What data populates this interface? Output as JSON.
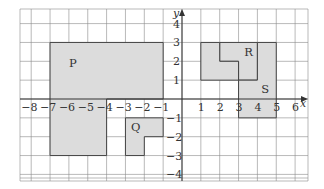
{
  "diagram": {
    "type": "coordinate-grid",
    "x_axis": {
      "label": "x",
      "min": -8,
      "max": 6,
      "ticks": [
        "−8",
        "−7",
        "−6",
        "−5",
        "−4",
        "−3",
        "−2",
        "−1",
        "1",
        "2",
        "3",
        "4",
        "5",
        "6"
      ]
    },
    "y_axis": {
      "label": "y",
      "min": -4,
      "max": 4,
      "ticks": [
        "4",
        "3",
        "2",
        "1",
        "−1",
        "−2",
        "−3",
        "−4"
      ]
    },
    "shapes": [
      {
        "name": "P",
        "label": "P",
        "vertices": [
          [
            -7,
            3
          ],
          [
            -1,
            3
          ],
          [
            -1,
            0
          ],
          [
            -4,
            0
          ],
          [
            -4,
            -3
          ],
          [
            -7,
            -3
          ]
        ],
        "label_pos": [
          -6,
          1.7
        ]
      },
      {
        "name": "Q",
        "label": "Q",
        "vertices": [
          [
            -3,
            -1
          ],
          [
            -1,
            -1
          ],
          [
            -1,
            -2
          ],
          [
            -2,
            -2
          ],
          [
            -2,
            -3
          ],
          [
            -3,
            -3
          ]
        ],
        "label_pos": [
          -2.7,
          -1.7
        ]
      },
      {
        "name": "R",
        "label": "R",
        "vertices": [
          [
            2,
            3
          ],
          [
            4,
            3
          ],
          [
            4,
            1
          ],
          [
            3,
            1
          ],
          [
            3,
            2
          ],
          [
            2,
            2
          ]
        ],
        "label_pos": [
          3.3,
          2.3
        ]
      },
      {
        "name": "unlabeled",
        "label": "",
        "vertices": [
          [
            1,
            3
          ],
          [
            2,
            3
          ],
          [
            2,
            2
          ],
          [
            3,
            2
          ],
          [
            3,
            1
          ],
          [
            1,
            1
          ]
        ]
      },
      {
        "name": "S",
        "label": "S",
        "vertices": [
          [
            4,
            3
          ],
          [
            5,
            3
          ],
          [
            5,
            -1
          ],
          [
            3,
            -1
          ],
          [
            3,
            1
          ],
          [
            4,
            1
          ]
        ],
        "label_pos": [
          4.2,
          0.3
        ]
      }
    ],
    "colors": {
      "fill": "#dcdcdc",
      "outline": "#444444",
      "grid": "#8a8a8a"
    }
  }
}
